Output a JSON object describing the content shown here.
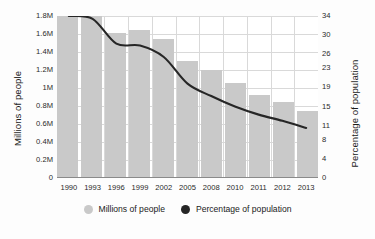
{
  "chart_data": {
    "type": "bar",
    "title": "",
    "xlabel": "",
    "ylabel": "Millions of people",
    "ylabel_right": "Percentage of population",
    "categories": [
      "1990",
      "1993",
      "1996",
      "1999",
      "2002",
      "2005",
      "2008",
      "2010",
      "2011",
      "2012",
      "2013"
    ],
    "series": [
      {
        "name": "Millions of people",
        "type": "bar",
        "axis": "left",
        "color": "#c9c9c9",
        "values": [
          1.8,
          1.8,
          1.61,
          1.64,
          1.54,
          1.3,
          1.2,
          1.06,
          0.92,
          0.85,
          0.74
        ]
      },
      {
        "name": "Percentage of population",
        "type": "line",
        "axis": "right",
        "color": "#262626",
        "values": [
          34,
          33.4,
          28.2,
          27.8,
          25.4,
          19.8,
          17.2,
          15.0,
          13.3,
          12.0,
          10.5
        ]
      }
    ],
    "ylim": [
      0,
      1.8
    ],
    "ylim_right": [
      0,
      34
    ],
    "yticks": [
      "1.8M",
      "1.6M",
      "1.4M",
      "1.2M",
      "1M",
      "0.8M",
      "0.6M",
      "0.4M",
      "0.2M",
      "0"
    ],
    "ytick_values": [
      1.8,
      1.6,
      1.4,
      1.2,
      1.0,
      0.8,
      0.6,
      0.4,
      0.2,
      0
    ],
    "yticks_right": [
      "34",
      "30",
      "26",
      "23",
      "19",
      "15",
      "11",
      "8",
      "4",
      "0"
    ],
    "ytick_right_values": [
      34,
      30,
      26,
      23,
      19,
      15,
      11,
      8,
      4,
      0
    ],
    "grid": true,
    "legend_position": "bottom",
    "legend": [
      {
        "label": "Millions of people",
        "color": "#c9c9c9",
        "marker": "circle"
      },
      {
        "label": "Percentage of population",
        "color": "#262626",
        "marker": "circle"
      }
    ]
  }
}
